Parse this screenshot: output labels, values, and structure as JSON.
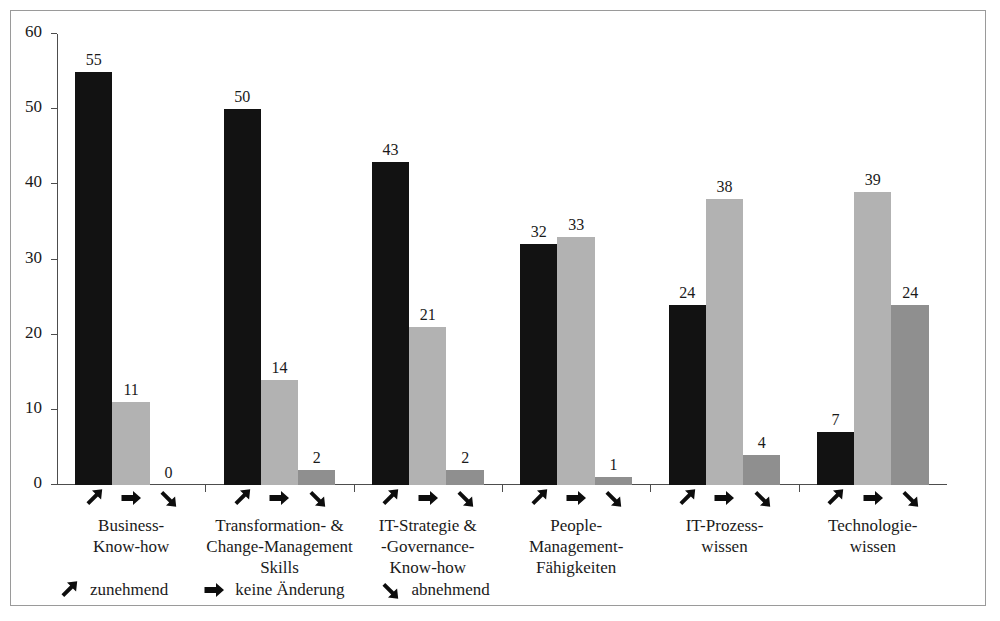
{
  "chart_data": {
    "type": "bar",
    "title": "",
    "subtitle": "",
    "xlabel": "",
    "ylabel": "",
    "ylim": [
      0,
      60
    ],
    "yticks": [
      0,
      10,
      20,
      30,
      40,
      50,
      60
    ],
    "grid": false,
    "legend_position": "bottom-left",
    "categories": [
      "Business-\nKnow-how",
      "Transformation- &\nChange-Management\nSkills",
      "IT-Strategie &\n-Governance-\nKnow-how",
      "People-\nManagement-\nFähigkeiten",
      "IT-Prozess-\nwissen",
      "Technologie-\nwissen"
    ],
    "series": [
      {
        "name": "zunehmend",
        "icon": "arrow-up-right-icon",
        "color": "#121212",
        "values": [
          55,
          50,
          43,
          32,
          24,
          7
        ]
      },
      {
        "name": "keine Änderung",
        "icon": "arrow-right-icon",
        "color": "#b2b2b2",
        "values": [
          11,
          14,
          21,
          33,
          38,
          39
        ]
      },
      {
        "name": "abnehmend",
        "icon": "arrow-down-right-icon",
        "color": "#8f8f8f",
        "values": [
          0,
          2,
          2,
          1,
          4,
          24
        ]
      }
    ]
  },
  "axis": {
    "tick_labels": [
      "60",
      "50",
      "40",
      "30",
      "20",
      "10",
      "0"
    ]
  },
  "categories": {
    "c0": {
      "l0": "Business-",
      "l1": "Know-how",
      "l2": ""
    },
    "c1": {
      "l0": "Transformation- &",
      "l1": "Change-Management",
      "l2": "Skills"
    },
    "c2": {
      "l0": "IT-Strategie &",
      "l1": "-Governance-",
      "l2": "Know-how"
    },
    "c3": {
      "l0": "People-",
      "l1": "Management-",
      "l2": "Fähigkeiten"
    },
    "c4": {
      "l0": "IT-Prozess-",
      "l1": "wissen",
      "l2": ""
    },
    "c5": {
      "l0": "Technologie-",
      "l1": "wissen",
      "l2": ""
    }
  },
  "labels": {
    "g0": {
      "s0": "55",
      "s1": "11",
      "s2": "0"
    },
    "g1": {
      "s0": "50",
      "s1": "14",
      "s2": "2"
    },
    "g2": {
      "s0": "43",
      "s1": "21",
      "s2": "2"
    },
    "g3": {
      "s0": "32",
      "s1": "33",
      "s2": "1"
    },
    "g4": {
      "s0": "24",
      "s1": "38",
      "s2": "4"
    },
    "g5": {
      "s0": "7",
      "s1": "39",
      "s2": "24"
    }
  },
  "legend": {
    "items": [
      {
        "icon": "arrow-up-right-icon",
        "label": "zunehmend"
      },
      {
        "icon": "arrow-right-icon",
        "label": "keine Änderung"
      },
      {
        "icon": "arrow-down-right-icon",
        "label": "abnehmend"
      }
    ]
  },
  "colors": {
    "series_increasing": "#121212",
    "series_nochange": "#b2b2b2",
    "series_decreasing": "#8f8f8f",
    "axis": "#4d4d4d",
    "border": "#9a9a9a",
    "text": "#1a1a1a",
    "background": "#ffffff"
  }
}
